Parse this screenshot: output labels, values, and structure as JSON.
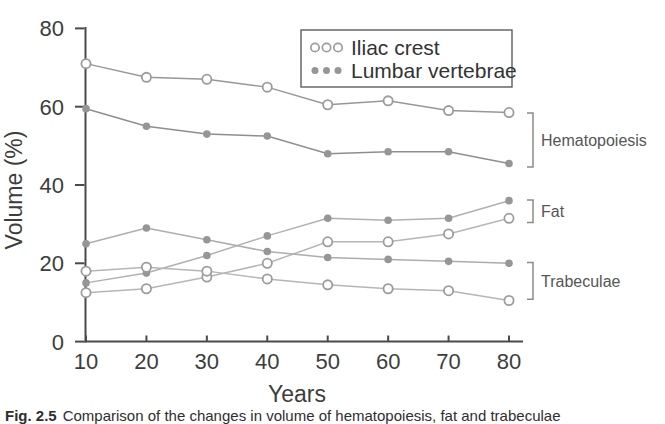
{
  "figure": {
    "y_axis": {
      "label": "Volume (%)",
      "ticks": [
        0,
        20,
        40,
        60,
        80
      ],
      "range": [
        0,
        80
      ]
    },
    "x_axis": {
      "label": "Years",
      "ticks": [
        10,
        20,
        30,
        40,
        50,
        60,
        70,
        80
      ],
      "range": [
        10,
        80
      ]
    },
    "legend": {
      "items": [
        {
          "label": "Iliac crest",
          "marker": "open"
        },
        {
          "label": "Lumbar vertebrae",
          "marker": "filled"
        }
      ]
    },
    "annotations": [
      {
        "label": "Hematopoiesis",
        "covers_values": [
          44.6,
          58.4
        ]
      },
      {
        "label": "Fat",
        "covers_values": [
          30.4,
          36.2
        ]
      },
      {
        "label": "Trabeculae",
        "covers_values": [
          10.8,
          20.2
        ]
      }
    ],
    "caption_prefix": "Fig. 2.5",
    "caption_text": "Comparison of the changes in volume of hematopoiesis, fat and trabeculae",
    "colors": {
      "axis": "#4a4a4a",
      "text": "#3d3d3d",
      "bracket": "#8a8a8a",
      "bracket_label": "#565656",
      "legend_border": "#5d5d5d",
      "open_marker_stroke": "#9c9c9c",
      "filled_marker_fill": "#969696"
    }
  },
  "chart_data": {
    "type": "line",
    "title": "",
    "xlabel": "Years",
    "ylabel": "Volume (%)",
    "x": [
      10,
      20,
      30,
      40,
      50,
      60,
      70,
      80
    ],
    "xlim": [
      10,
      80
    ],
    "ylim": [
      0,
      80
    ],
    "grid": false,
    "legend_position": "top-right inside",
    "series": [
      {
        "name": "Iliac crest - Hematopoiesis",
        "site": "Iliac crest",
        "tissue": "Hematopoiesis",
        "marker": "open",
        "color": "#979797",
        "values": [
          71,
          67.5,
          67,
          65,
          60.5,
          61.5,
          59,
          58.5
        ]
      },
      {
        "name": "Lumbar vertebrae - Hematopoiesis",
        "site": "Lumbar vertebrae",
        "tissue": "Hematopoiesis",
        "marker": "filled",
        "color": "#8e8e8e",
        "values": [
          59.5,
          55,
          53,
          52.5,
          48,
          48.5,
          48.5,
          45.5
        ]
      },
      {
        "name": "Lumbar vertebrae - Fat",
        "site": "Lumbar vertebrae",
        "tissue": "Fat",
        "marker": "filled",
        "color": "#b0b0b0",
        "values": [
          15,
          17.5,
          22,
          27,
          31.5,
          31,
          31.5,
          36
        ]
      },
      {
        "name": "Iliac crest - Fat",
        "site": "Iliac crest",
        "tissue": "Fat",
        "marker": "open",
        "color": "#b6b6b6",
        "values": [
          12.5,
          13.5,
          16.5,
          20,
          25.5,
          25.5,
          27.5,
          31.5
        ]
      },
      {
        "name": "Lumbar vertebrae - Trabeculae",
        "site": "Lumbar vertebrae",
        "tissue": "Trabeculae",
        "marker": "filled",
        "color": "#adadad",
        "values": [
          25,
          29,
          26,
          23,
          21.5,
          21,
          20.5,
          20
        ]
      },
      {
        "name": "Iliac crest - Trabeculae",
        "site": "Iliac crest",
        "tissue": "Trabeculae",
        "marker": "open",
        "color": "#b6b6b6",
        "values": [
          18,
          19,
          18,
          16,
          14.5,
          13.5,
          13,
          10.5
        ]
      }
    ]
  }
}
